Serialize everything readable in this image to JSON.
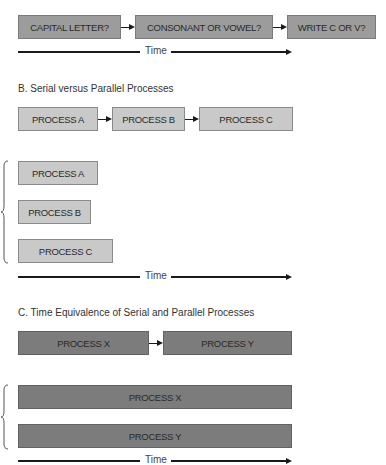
{
  "section_a": {
    "title": "A. The Decision Task",
    "boxes": [
      "CAPITAL LETTER?",
      "CONSONANT OR VOWEL?",
      "WRITE C OR V?"
    ],
    "time_label": "Time"
  },
  "section_b": {
    "title": "B. Serial versus Parallel Processes",
    "serial_boxes": [
      "PROCESS A",
      "PROCESS B",
      "PROCESS C"
    ],
    "parallel_boxes": [
      "PROCESS A",
      "PROCESS B",
      "PROCESS C"
    ],
    "time_label": "Time"
  },
  "section_c": {
    "title": "C. Time Equivalence of Serial and Parallel Processes",
    "serial_boxes": [
      "PROCESS X",
      "PROCESS Y"
    ],
    "parallel_boxes": [
      "PROCESS X",
      "PROCESS Y"
    ],
    "time_label": "Time"
  },
  "colors": {
    "section_a_fill": "#9c9c9c",
    "section_b_fill": "#c9c9c9",
    "section_c_fill": "#7c7c7c",
    "arrow": "#1a1a1a"
  }
}
